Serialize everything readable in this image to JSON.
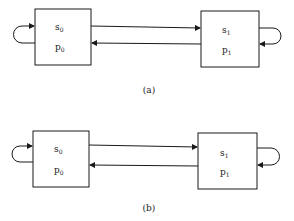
{
  "diagrams": [
    {
      "caption": "(a)",
      "left_box": {
        "line1": "s",
        "line1_sub": "0",
        "line2": "p",
        "line2_sub": "0"
      },
      "right_box": {
        "line1": "s",
        "line1_sub": "1",
        "line2": "p",
        "line2_sub": "1"
      }
    },
    {
      "caption": "(b)",
      "left_box": {
        "line1": "s",
        "line1_sub": "0",
        "line2": "p",
        "line2_sub": "0"
      },
      "right_box": {
        "line1": "s",
        "line1_sub": "1",
        "line2": "p",
        "line2_sub": "1"
      }
    }
  ],
  "colors": {
    "stroke": "#1a1a1a",
    "background": "#ffffff"
  }
}
